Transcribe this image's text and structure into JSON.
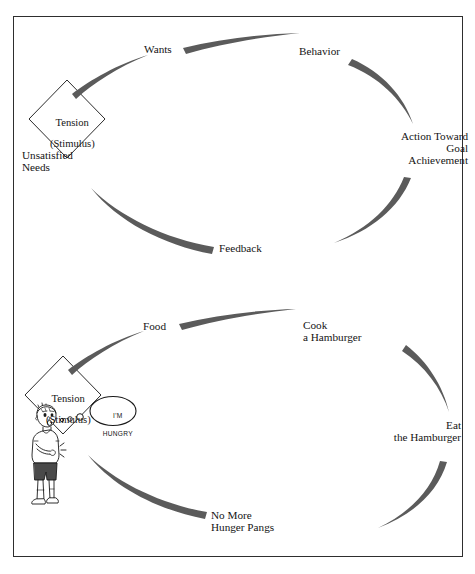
{
  "figure": {
    "background_color": "#ffffff",
    "frame_color": "#2e2e2e",
    "arrow_color": "#5b5b5b",
    "text_color": "#141414"
  },
  "diagram_top": {
    "name": "generic-motivation-cycle",
    "diamond": {
      "line1": "Tension",
      "line2": "(Stimulus)"
    },
    "nodes": [
      {
        "id": "unsatisfied-needs",
        "label": "Unsatisfied\nNeeds",
        "align": "left"
      },
      {
        "id": "wants",
        "label": "Wants",
        "align": "center"
      },
      {
        "id": "behavior",
        "label": "Behavior",
        "align": "center"
      },
      {
        "id": "action-toward-goal",
        "label": "Action Toward\nGoal\nAchievement",
        "align": "right"
      },
      {
        "id": "feedback",
        "label": "Feedback",
        "align": "center"
      }
    ],
    "arrows": [
      {
        "id": "arrow-needs-to-wants",
        "from": "unsatisfied-needs",
        "to": "wants"
      },
      {
        "id": "arrow-wants-to-behavior",
        "from": "wants",
        "to": "behavior"
      },
      {
        "id": "arrow-behavior-to-action",
        "from": "behavior",
        "to": "action-toward-goal"
      },
      {
        "id": "arrow-action-to-feedback",
        "from": "action-toward-goal",
        "to": "feedback"
      },
      {
        "id": "arrow-feedback-to-needs",
        "from": "feedback",
        "to": "unsatisfied-needs"
      }
    ]
  },
  "diagram_bottom": {
    "name": "hamburger-motivation-cycle",
    "diamond": {
      "line1": "Tension",
      "line2": "(Stimulus)"
    },
    "thought_bubble": {
      "line1": "I'M",
      "line2": "HUNGRY"
    },
    "character": {
      "name": "hungry-boy",
      "description": "cartoon boy holding his stomach"
    },
    "nodes": [
      {
        "id": "food",
        "label": "Food",
        "align": "center"
      },
      {
        "id": "cook-a-hamburger",
        "label": "Cook\na Hamburger",
        "align": "left"
      },
      {
        "id": "eat-the-hamburger",
        "label": "Eat\nthe Hamburger",
        "align": "right"
      },
      {
        "id": "no-more-hunger-pangs",
        "label": "No More\nHunger Pangs",
        "align": "left"
      }
    ],
    "arrows": [
      {
        "id": "arrow-tension-to-food",
        "from": "tension",
        "to": "food"
      },
      {
        "id": "arrow-food-to-cook",
        "from": "food",
        "to": "cook-a-hamburger"
      },
      {
        "id": "arrow-cook-to-eat",
        "from": "cook-a-hamburger",
        "to": "eat-the-hamburger"
      },
      {
        "id": "arrow-eat-to-pangs",
        "from": "eat-the-hamburger",
        "to": "no-more-hunger-pangs"
      },
      {
        "id": "arrow-pangs-to-tension",
        "from": "no-more-hunger-pangs",
        "to": "tension"
      }
    ]
  }
}
